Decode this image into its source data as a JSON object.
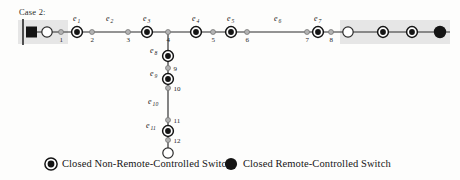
{
  "figure": {
    "case_label": "Case 2:",
    "background": "#fdfdfc",
    "line_color": "#2a2a2a",
    "shade_color": "#e6e6e6"
  },
  "legend": {
    "items": [
      {
        "key": "non-remote",
        "marker": "double-ring-filled-circle",
        "label": "Closed Non-Remote-Controlled Switch"
      },
      {
        "key": "remote",
        "marker": "solid-filled-circle",
        "label": "Closed Remote-Controlled Switch"
      }
    ]
  },
  "chart_data": {
    "type": "diagram",
    "title": "Case 2:",
    "shaded_regions": [
      {
        "name": "left-shade",
        "x": 18,
        "y": 20,
        "width": 50,
        "height": 24
      },
      {
        "name": "right-shade",
        "x": 340,
        "y": 20,
        "width": 110,
        "height": 24
      }
    ],
    "substation": {
      "name": "substation-busbar",
      "x": 25,
      "y": 32
    },
    "nodes": [
      {
        "id": "sub-open",
        "label": "",
        "x": 47,
        "y": 32,
        "type": "open-circle"
      },
      {
        "id": "1",
        "label": "1",
        "x": 61,
        "y": 32,
        "type": "junction"
      },
      {
        "id": "2",
        "label": "2",
        "x": 92,
        "y": 32,
        "type": "junction"
      },
      {
        "id": "3",
        "label": "3",
        "x": 128,
        "y": 32,
        "type": "junction"
      },
      {
        "id": "4",
        "label": "4",
        "x": 168,
        "y": 32,
        "type": "junction"
      },
      {
        "id": "5",
        "label": "5",
        "x": 213,
        "y": 32,
        "type": "junction"
      },
      {
        "id": "6",
        "label": "6",
        "x": 247,
        "y": 32,
        "type": "junction"
      },
      {
        "id": "7",
        "label": "7",
        "x": 307,
        "y": 32,
        "type": "junction"
      },
      {
        "id": "8",
        "label": "8",
        "x": 331,
        "y": 32,
        "type": "junction"
      },
      {
        "id": "end-open-right",
        "label": "",
        "x": 348,
        "y": 32,
        "type": "open-circle"
      },
      {
        "id": "9",
        "label": "9",
        "x": 168,
        "y": 68,
        "type": "junction"
      },
      {
        "id": "10",
        "label": "10",
        "x": 168,
        "y": 88,
        "type": "junction"
      },
      {
        "id": "11",
        "label": "11",
        "x": 168,
        "y": 120,
        "type": "junction"
      },
      {
        "id": "12",
        "label": "12",
        "x": 168,
        "y": 140,
        "type": "junction"
      },
      {
        "id": "end-open-bottom",
        "label": "",
        "x": 168,
        "y": 153,
        "type": "open-circle"
      }
    ],
    "switches": [
      {
        "id": "e1",
        "label": "e",
        "sub": "1",
        "x": 77,
        "y": 32,
        "type": "non-remote",
        "label_x": 73,
        "label_y": 21
      },
      {
        "id": "e3",
        "label": "e",
        "sub": "3",
        "x": 147,
        "y": 32,
        "type": "non-remote",
        "label_x": 143,
        "label_y": 21
      },
      {
        "id": "e4",
        "label": "e",
        "sub": "4",
        "x": 196,
        "y": 32,
        "type": "non-remote",
        "label_x": 192,
        "label_y": 21
      },
      {
        "id": "e5",
        "label": "e",
        "sub": "5",
        "x": 231,
        "y": 32,
        "type": "non-remote",
        "label_x": 227,
        "label_y": 21
      },
      {
        "id": "e7",
        "label": "e",
        "sub": "7",
        "x": 318,
        "y": 32,
        "type": "non-remote",
        "label_x": 314,
        "label_y": 21
      },
      {
        "id": "e8",
        "label": "e",
        "sub": "8",
        "x": 168,
        "y": 56,
        "type": "non-remote",
        "label_x": 150,
        "label_y": 53
      },
      {
        "id": "e9",
        "label": "e",
        "sub": "9",
        "x": 168,
        "y": 79,
        "type": "non-remote",
        "label_x": 150,
        "label_y": 76
      },
      {
        "id": "e11",
        "label": "e",
        "sub": "11",
        "x": 168,
        "y": 131,
        "type": "non-remote",
        "label_x": 146,
        "label_y": 128
      },
      {
        "id": "r1",
        "label": "",
        "sub": "",
        "x": 383,
        "y": 32,
        "type": "non-remote",
        "label_x": 0,
        "label_y": 0
      },
      {
        "id": "r2",
        "label": "",
        "sub": "",
        "x": 412,
        "y": 32,
        "type": "non-remote",
        "label_x": 0,
        "label_y": 0
      }
    ],
    "remote_switches": [
      {
        "id": "rc-end",
        "x": 440,
        "y": 32,
        "type": "remote"
      }
    ],
    "edge_labels": [
      {
        "id": "e2",
        "label": "e",
        "sub": "2",
        "x": 106,
        "y": 21
      },
      {
        "id": "e6",
        "label": "e",
        "sub": "6",
        "x": 274,
        "y": 21
      },
      {
        "id": "e10",
        "label": "e",
        "sub": "10",
        "x": 148,
        "y": 104
      }
    ],
    "edges": [
      {
        "from": "busbar",
        "to": "end-open-right",
        "orientation": "horizontal",
        "y": 32,
        "x1": 33,
        "x2": 450
      },
      {
        "from": "4",
        "to": "end-open-bottom",
        "orientation": "vertical",
        "x": 168,
        "y1": 32,
        "y2": 153
      }
    ]
  }
}
